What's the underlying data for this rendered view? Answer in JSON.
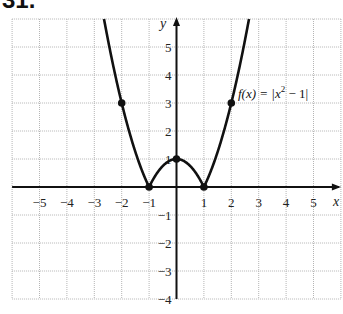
{
  "problem": {
    "number": "31."
  },
  "chart_data": {
    "type": "line",
    "title": "",
    "function_label": "f(x) = |x² − 1|",
    "function_label_parts": {
      "lhs": "f(x) = |x",
      "exp": "2",
      "rhs": " − 1|"
    },
    "xlabel": "x",
    "ylabel": "y",
    "xlim": [
      -6,
      6
    ],
    "ylim": [
      -4,
      6
    ],
    "grid": true,
    "x_ticks": [
      "−5",
      "−4",
      "−3",
      "−2",
      "−1",
      "1",
      "2",
      "3",
      "4",
      "5"
    ],
    "x_tick_values": [
      -5,
      -4,
      -3,
      -2,
      -1,
      1,
      2,
      3,
      4,
      5
    ],
    "y_ticks": [
      "5",
      "4",
      "3",
      "2",
      "1",
      "−1",
      "−2",
      "−3",
      "−4"
    ],
    "y_tick_values": [
      5,
      4,
      3,
      2,
      1,
      -1,
      -2,
      -3,
      -4
    ],
    "series": [
      {
        "name": "f(x) = |x² − 1|",
        "x": [
          -2.55,
          -2,
          -1.5,
          -1,
          -0.5,
          0,
          0.5,
          1,
          1.5,
          2,
          2.55
        ],
        "y": [
          5.5,
          3,
          1.25,
          0,
          0.75,
          1,
          0.75,
          0,
          1.25,
          3,
          5.5
        ]
      }
    ],
    "marked_points": [
      {
        "x": -2,
        "y": 3
      },
      {
        "x": -1,
        "y": 0
      },
      {
        "x": 0,
        "y": 1
      },
      {
        "x": 1,
        "y": 0
      },
      {
        "x": 2,
        "y": 3
      }
    ]
  }
}
